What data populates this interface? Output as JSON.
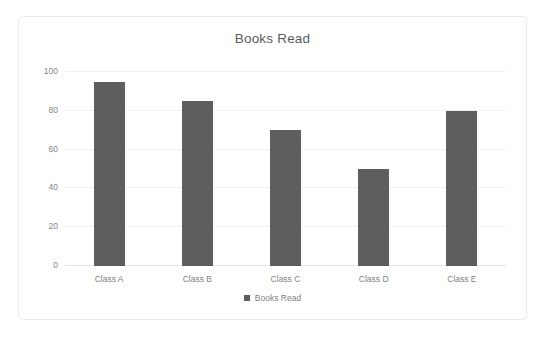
{
  "chart_data": {
    "type": "bar",
    "title": "Books Read",
    "categories": [
      "Class A",
      "Class B",
      "Class C",
      "Class D",
      "Class E"
    ],
    "values": [
      95,
      85,
      70,
      50,
      80
    ],
    "series": [
      {
        "name": "Books Read",
        "values": [
          95,
          85,
          70,
          50,
          80
        ]
      }
    ],
    "xlabel": "",
    "ylabel": "",
    "ylim": [
      0,
      100
    ],
    "yticks": [
      0,
      20,
      40,
      60,
      80,
      100
    ],
    "ytick_labels": [
      "0",
      "20",
      "40",
      "60",
      "80",
      "100"
    ],
    "grid": true,
    "legend": {
      "position": "bottom",
      "entries": [
        "Books Read"
      ]
    },
    "colors": {
      "bar": "#5e5e5e",
      "title_text": "#5b5b5b",
      "tick_text": "#7f7f7f",
      "gridline": "#f1f1f2",
      "axis_line": "#e4e4e5",
      "card_border": "#ececed",
      "background": "#ffffff"
    }
  }
}
